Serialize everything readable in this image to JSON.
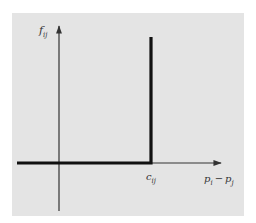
{
  "diagram": {
    "type": "step-function plot",
    "y_axis": {
      "label_base": "f",
      "label_sub": "ij"
    },
    "x_axis": {
      "label_left_base": "p",
      "label_left_sub": "i",
      "label_op": "−",
      "label_right_base": "p",
      "label_right_sub": "j"
    },
    "threshold": {
      "label_base": "c",
      "label_sub": "ij"
    },
    "colors": {
      "panel_background": "#e4e4e4",
      "axis": "#333333",
      "curve": "#111111"
    }
  }
}
